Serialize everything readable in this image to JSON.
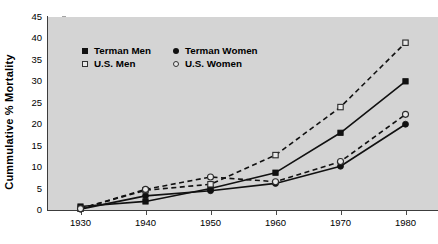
{
  "chart_data": {
    "type": "line",
    "title": "",
    "xlabel": "",
    "ylabel": "Cummulative % Mortality",
    "x": [
      1930,
      1940,
      1950,
      1960,
      1970,
      1980
    ],
    "xlim": [
      1925,
      1985
    ],
    "ylim": [
      0,
      45
    ],
    "ytick_labels": [
      "0",
      "5",
      "10",
      "15",
      "20",
      "25",
      "30",
      "35",
      "40",
      "45"
    ],
    "ytick_values": [
      0,
      5,
      10,
      15,
      20,
      25,
      30,
      35,
      40,
      45
    ],
    "xtick_labels": [
      "1930",
      "1940",
      "1950",
      "1960",
      "1970",
      "1980"
    ],
    "grid": false,
    "legend_position": "upper-left-inside",
    "series": [
      {
        "name": "Terman Men",
        "marker": "filled-square",
        "line_style": "solid",
        "values": [
          0.8,
          2.0,
          5.0,
          8.7,
          18.0,
          30.0
        ]
      },
      {
        "name": "Terman Women",
        "marker": "filled-circle",
        "line_style": "solid",
        "values": [
          0.2,
          3.3,
          4.5,
          6.2,
          10.2,
          20.0
        ]
      },
      {
        "name": "U.S. Men",
        "marker": "open-square",
        "line_style": "dashed",
        "values": [
          0.3,
          4.6,
          6.0,
          12.8,
          24.0,
          39.0
        ]
      },
      {
        "name": "U.S. Women",
        "marker": "open-circle",
        "line_style": "dashed",
        "values": [
          0.3,
          4.8,
          7.7,
          6.6,
          11.3,
          22.3
        ]
      }
    ]
  },
  "legend": {
    "entries": [
      {
        "label": "Terman Men",
        "marker": "filled-square"
      },
      {
        "label": "Terman Women",
        "marker": "filled-circle"
      },
      {
        "label": "U.S. Men",
        "marker": "open-square"
      },
      {
        "label": "U.S. Women",
        "marker": "open-circle"
      }
    ]
  },
  "colors": {
    "plot_background": "#d4d4d4",
    "page_background": "#ffffff",
    "axis": "#3c3c3c",
    "series_ink": "#111111",
    "marker_open_fill": "#e8e8e8"
  }
}
